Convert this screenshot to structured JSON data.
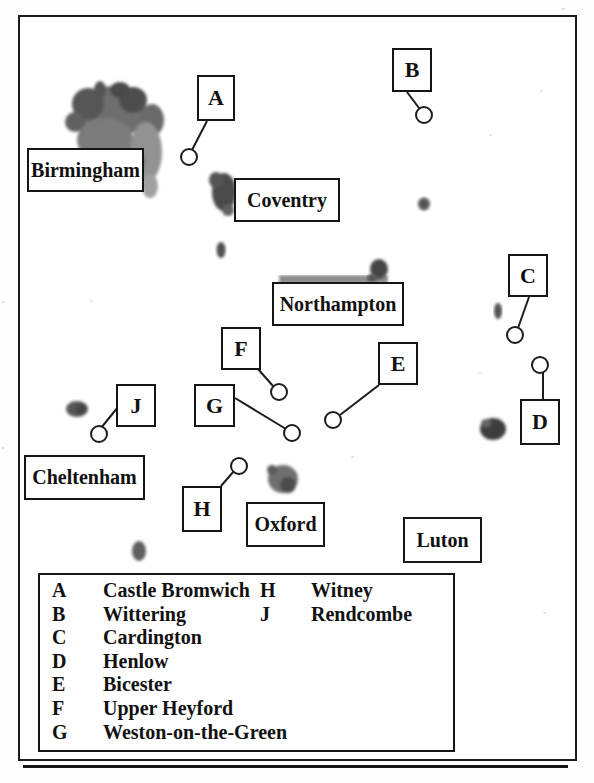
{
  "map": {
    "cities": [
      {
        "label": "Birmingham"
      },
      {
        "label": "Coventry"
      },
      {
        "label": "Northampton"
      },
      {
        "label": "Cheltenham"
      },
      {
        "label": "Oxford"
      },
      {
        "label": "Luton"
      }
    ],
    "markers": [
      {
        "letter": "A"
      },
      {
        "letter": "B"
      },
      {
        "letter": "C"
      },
      {
        "letter": "D"
      },
      {
        "letter": "E"
      },
      {
        "letter": "F"
      },
      {
        "letter": "G"
      },
      {
        "letter": "H"
      },
      {
        "letter": "J"
      }
    ]
  },
  "legend": {
    "entries": [
      {
        "letter": "A",
        "name": "Castle Bromwich"
      },
      {
        "letter": "B",
        "name": "Wittering"
      },
      {
        "letter": "C",
        "name": "Cardington"
      },
      {
        "letter": "D",
        "name": "Henlow"
      },
      {
        "letter": "E",
        "name": "Bicester"
      },
      {
        "letter": "F",
        "name": "Upper Heyford"
      },
      {
        "letter": "G",
        "name": "Weston-on-the-Green"
      },
      {
        "letter": "H",
        "name": "Witney"
      },
      {
        "letter": "J",
        "name": "Rendcombe"
      }
    ]
  },
  "colors": {
    "ink": "#1c1c1c",
    "urban_area_dark": "#4a4a4a",
    "urban_area_light": "#8f8f8f",
    "paper": "#ffffff"
  }
}
